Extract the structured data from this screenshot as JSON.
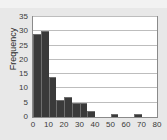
{
  "chart_data": {
    "type": "bar",
    "title": "",
    "subtitle": "",
    "xlabel": "",
    "ylabel": "Frequency",
    "xlim": [
      0,
      80
    ],
    "ylim": [
      0,
      35
    ],
    "grid": true,
    "legend": null,
    "x_ticks": [
      0,
      10,
      20,
      30,
      40,
      50,
      60,
      70,
      80
    ],
    "y_ticks": [
      0,
      5,
      10,
      15,
      20,
      25,
      30,
      35
    ],
    "bin_width": 5,
    "bar_color": "#3a3a3a",
    "plot_background": "#ffffff",
    "figure_background": "#e8e8e8",
    "gridline_color": "#bdbdbd",
    "bins": [
      {
        "start": 0,
        "end": 5,
        "value": 29
      },
      {
        "start": 5,
        "end": 10,
        "value": 30
      },
      {
        "start": 10,
        "end": 15,
        "value": 14
      },
      {
        "start": 15,
        "end": 20,
        "value": 6
      },
      {
        "start": 20,
        "end": 25,
        "value": 7
      },
      {
        "start": 25,
        "end": 30,
        "value": 5
      },
      {
        "start": 30,
        "end": 35,
        "value": 5
      },
      {
        "start": 35,
        "end": 40,
        "value": 2
      },
      {
        "start": 40,
        "end": 45,
        "value": 0
      },
      {
        "start": 45,
        "end": 50,
        "value": 0
      },
      {
        "start": 50,
        "end": 55,
        "value": 1
      },
      {
        "start": 55,
        "end": 60,
        "value": 0
      },
      {
        "start": 60,
        "end": 65,
        "value": 0
      },
      {
        "start": 65,
        "end": 70,
        "value": 1
      },
      {
        "start": 70,
        "end": 75,
        "value": 0
      },
      {
        "start": 75,
        "end": 80,
        "value": 0
      }
    ],
    "categories": [
      "0-5",
      "5-10",
      "10-15",
      "15-20",
      "20-25",
      "25-30",
      "30-35",
      "35-40",
      "40-45",
      "45-50",
      "50-55",
      "55-60",
      "60-65",
      "65-70",
      "70-75",
      "75-80"
    ],
    "values": [
      29,
      30,
      14,
      6,
      7,
      5,
      5,
      2,
      0,
      0,
      1,
      0,
      0,
      1,
      0,
      0
    ]
  }
}
